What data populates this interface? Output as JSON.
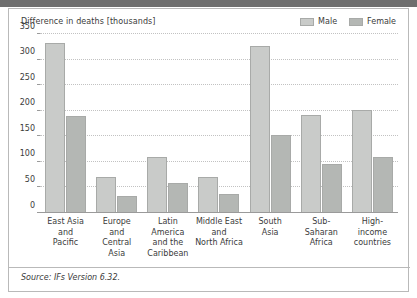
{
  "chart_data": {
    "type": "bar",
    "title": "",
    "ylabel": "Difference in deaths [thousands]",
    "xlabel": "",
    "ylim": [
      0,
      350
    ],
    "yticks": [
      0,
      50,
      100,
      150,
      200,
      250,
      300,
      350
    ],
    "grid": true,
    "legend_position": "top-right",
    "categories": [
      "East Asia and Pacific",
      "Europe and Central Asia",
      "Latin America and the Caribbean",
      "Middle East and North Africa",
      "South Asia",
      "Sub-Saharan Africa",
      "High-income countries"
    ],
    "category_lines": [
      [
        "East Asia",
        "and",
        "Pacific"
      ],
      [
        "Europe",
        "and",
        "Central",
        "Asia"
      ],
      [
        "Latin",
        "America",
        "and the",
        "Caribbean"
      ],
      [
        "Middle East",
        "and",
        "North Africa"
      ],
      [
        "South",
        "Asia"
      ],
      [
        "Sub-",
        "Saharan",
        "Africa"
      ],
      [
        "High-",
        "income",
        "countries"
      ]
    ],
    "series": [
      {
        "name": "Male",
        "color": "#c9cbc9",
        "values": [
          332,
          70,
          110,
          70,
          327,
          192,
          202
        ]
      },
      {
        "name": "Female",
        "color": "#b4b7b4",
        "values": [
          190,
          34,
          59,
          37,
          152,
          96,
          110
        ]
      }
    ]
  },
  "legend": {
    "items": [
      {
        "label": "Male",
        "color": "#c9cbc9"
      },
      {
        "label": "Female",
        "color": "#b4b7b4"
      }
    ]
  },
  "footer": {
    "source": "Source: IFs Version 6.32."
  }
}
